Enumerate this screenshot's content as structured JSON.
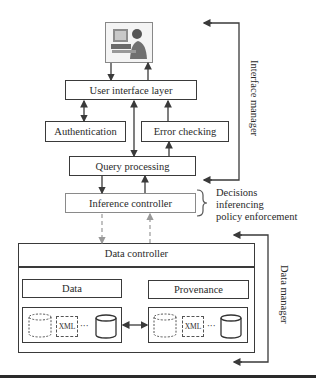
{
  "diagram": {
    "user_image": "user-at-computer-icon",
    "boxes": {
      "user_interface_layer": "User interface layer",
      "authentication": "Authentication",
      "error_checking": "Error checking",
      "query_processing": "Query processing",
      "inference_controller": "Inference controller",
      "data_controller": "Data controller",
      "data": "Data",
      "provenance": "Provenance"
    },
    "store_labels": {
      "data_xml": "XML",
      "data_ellipsis": "···",
      "prov_xml": "XML",
      "prov_ellipsis": "···"
    },
    "annotations": {
      "interface_manager": "Interface manager",
      "data_manager": "Data manager",
      "inference_notes": [
        "Decisions",
        "inferencing",
        "policy enforcement"
      ]
    }
  }
}
